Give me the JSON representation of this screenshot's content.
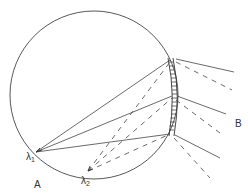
{
  "diagram": {
    "type": "rowland-circle-concave-grating",
    "labels": {
      "lambda1": "λ",
      "lambda1_sub": "1",
      "lambda2": "λ",
      "lambda2_sub": "2",
      "point_a": "A",
      "point_b": "B"
    },
    "colors": {
      "stroke": "#444444",
      "background": "#ffffff"
    }
  }
}
